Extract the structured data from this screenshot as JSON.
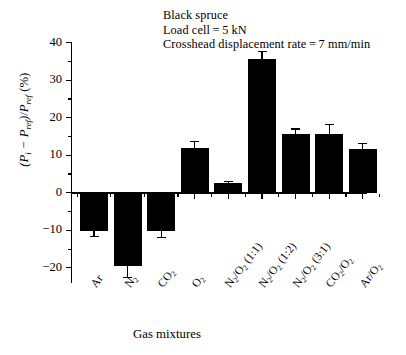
{
  "annotation": {
    "line1": "Black spruce",
    "line2": "Load cell = 5 kN",
    "line3": "Crosshead displacement rate = 7 mm/min"
  },
  "axes": {
    "x_title": "Gas mixtures",
    "y_title_plain": "(Pi − Pref)/Pref (%)"
  },
  "chart_data": {
    "type": "bar",
    "title": "",
    "xlabel": "Gas mixtures",
    "ylabel": "(P_i − P_ref)/P_ref (%)",
    "ylim": [
      -23,
      44
    ],
    "yticks": [
      -20,
      -10,
      0,
      10,
      20,
      30,
      40
    ],
    "ytick_labels": [
      "−20",
      "−10",
      "0",
      "10",
      "20",
      "30",
      "40"
    ],
    "yminor_step": 5,
    "grid": false,
    "legend": null,
    "bar_color": "#000000",
    "categories": [
      "Ar",
      "N2",
      "CO2",
      "O2",
      "N2/O2 (1:1)",
      "N2/O2 (1:2)",
      "N2/O2 (3:1)",
      "CO2/O2",
      "Ar/O2"
    ],
    "category_labels_html": [
      "Ar",
      "N<sub>2</sub>",
      "CO<sub>2</sub>",
      "O<sub>2</sub>",
      "N<sub>2</sub>/O<sub>2</sub> (1:1)",
      "N<sub>2</sub>/O<sub>2</sub> (1:2)",
      "N<sub>2</sub>/O<sub>2</sub> (3:1)",
      "CO<sub>2</sub>/O<sub>2</sub>",
      "Ar/O<sub>2</sub>"
    ],
    "values": [
      -10.1,
      -19.5,
      -10.2,
      12.0,
      2.7,
      35.7,
      15.6,
      15.6,
      11.6
    ],
    "errors": [
      1.6,
      3.0,
      1.7,
      1.6,
      0.4,
      1.9,
      1.4,
      2.6,
      1.5
    ],
    "annotations": [
      "Black spruce",
      "Load cell = 5 kN",
      "Crosshead displacement rate = 7 mm/min"
    ]
  }
}
